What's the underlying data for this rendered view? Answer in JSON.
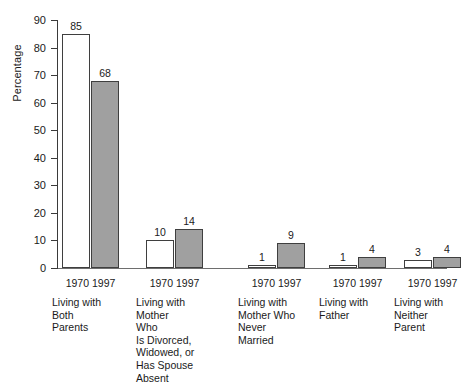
{
  "chart_data": {
    "type": "bar",
    "title": "",
    "subtitle": "",
    "xlabel": "",
    "ylabel": "Percentage",
    "ylim": [
      0,
      90
    ],
    "ytick_step": 10,
    "yticks": [
      0,
      10,
      20,
      30,
      40,
      50,
      60,
      70,
      80,
      90
    ],
    "grid": false,
    "legend_position": "none",
    "categories": [
      "Living with Both Parents",
      "Living with Mother Who Is Divorced, Widowed, or Has Spouse Absent",
      "Living with Mother Who Never Married",
      "Living with Father",
      "Living with Neither Parent"
    ],
    "category_lines": [
      [
        "Living with",
        "Both",
        "Parents"
      ],
      [
        "Living with",
        "Mother",
        "Who",
        "Is Divorced,",
        "Widowed, or",
        "Has Spouse",
        "Absent"
      ],
      [
        "Living with",
        "Mother Who",
        "Never",
        "Married"
      ],
      [
        "Living with",
        "Father"
      ],
      [
        "Living with",
        "Neither",
        "Parent"
      ]
    ],
    "series": [
      {
        "name": "1970",
        "values": [
          85,
          10,
          1,
          1,
          3
        ],
        "fill": "#ffffff",
        "stroke": "#3f3f3f"
      },
      {
        "name": "1997",
        "values": [
          68,
          14,
          9,
          4,
          4
        ],
        "fill": "#a0a0a0",
        "stroke": "#3f3f3f"
      }
    ],
    "bar_labels": {
      "1970": [
        "85",
        "10",
        "1",
        "1",
        "3"
      ],
      "1997": [
        "68",
        "14",
        "9",
        "4",
        "4"
      ]
    }
  },
  "axis": {
    "y_title": "Percentage",
    "y_tick_labels": [
      "90",
      "80",
      "70",
      "60",
      "50",
      "40",
      "30",
      "20",
      "10",
      "0"
    ]
  },
  "groups": [
    {
      "series_labels": "1970 1997",
      "lines": [
        "Living with",
        "Both",
        "Parents"
      ],
      "bars": [
        {
          "series": "1970",
          "value": 85,
          "label": "85"
        },
        {
          "series": "1997",
          "value": 68,
          "label": "68"
        }
      ]
    },
    {
      "series_labels": "1970 1997",
      "lines": [
        "Living with",
        "Mother",
        "Who",
        "Is Divorced,",
        "Widowed, or",
        "Has Spouse",
        "Absent"
      ],
      "bars": [
        {
          "series": "1970",
          "value": 10,
          "label": "10"
        },
        {
          "series": "1997",
          "value": 14,
          "label": "14"
        }
      ]
    },
    {
      "series_labels": "1970 1997",
      "lines": [
        "Living with",
        "Mother Who",
        "Never",
        "Married"
      ],
      "bars": [
        {
          "series": "1970",
          "value": 1,
          "label": "1"
        },
        {
          "series": "1997",
          "value": 9,
          "label": "9"
        }
      ]
    },
    {
      "series_labels": "1970 1997",
      "lines": [
        "Living with",
        "Father"
      ],
      "bars": [
        {
          "series": "1970",
          "value": 1,
          "label": "1"
        },
        {
          "series": "1997",
          "value": 4,
          "label": "4"
        }
      ]
    },
    {
      "series_labels": "1970 1997",
      "lines": [
        "Living with",
        "Neither",
        "Parent"
      ],
      "bars": [
        {
          "series": "1970",
          "value": 3,
          "label": "3"
        },
        {
          "series": "1997",
          "value": 4,
          "label": "4"
        }
      ]
    }
  ],
  "colors": {
    "series_1970_fill": "#ffffff",
    "series_1997_fill": "#a0a0a0",
    "bar_stroke": "#3f3f3f",
    "axis": "#3a3a3a",
    "text": "#1a1a1a",
    "background": "#ffffff"
  },
  "layout": {
    "plot_left": 57,
    "plot_baseline": 268,
    "plot_top": 20,
    "bar_width": 28,
    "group_x": [
      62,
      146,
      248,
      329,
      404
    ]
  }
}
